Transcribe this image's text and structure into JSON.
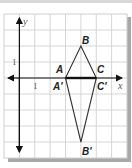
{
  "figure": {
    "axes": {
      "x_label": "x",
      "y_label": "y"
    },
    "tick_labels": {
      "x_unit": "1",
      "y_unit": "1"
    },
    "grid": {
      "x_min": -1,
      "x_max": 7,
      "y_min": -5,
      "y_max": 4,
      "step": 1
    },
    "triangle_original": {
      "name": "ABC",
      "vertices": [
        {
          "label": "A",
          "x": 3,
          "y": 0
        },
        {
          "label": "B",
          "x": 4,
          "y": 2
        },
        {
          "label": "C",
          "x": 5,
          "y": 0
        }
      ]
    },
    "triangle_image": {
      "name": "A'B'C'",
      "vertices": [
        {
          "label": "A'",
          "x": 3,
          "y": 0
        },
        {
          "label": "B'",
          "x": 4,
          "y": -4
        },
        {
          "label": "C'",
          "x": 5,
          "y": 0
        }
      ]
    },
    "colors": {
      "line": "#333333",
      "grid": "#c8c8c8",
      "shadow": "#a8a8a8"
    }
  }
}
